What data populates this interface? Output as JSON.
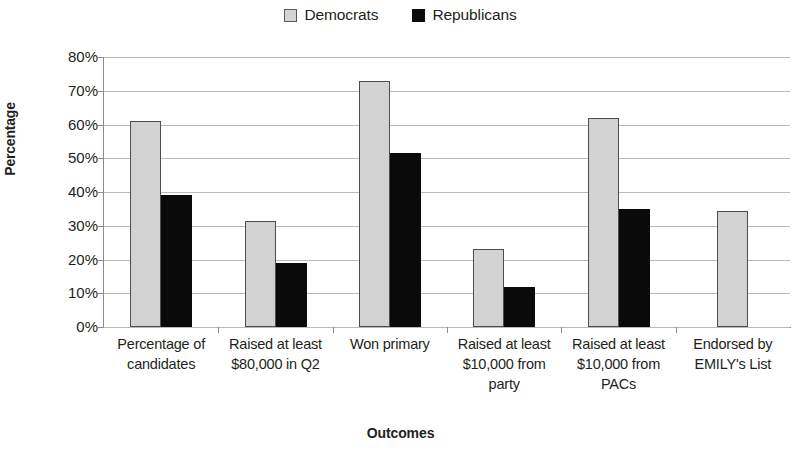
{
  "chart_data": {
    "type": "bar",
    "title": "",
    "xlabel": "Outcomes",
    "ylabel": "Percentage",
    "categories": [
      "Percentage of candidates",
      "Raised at least $80,000 in Q2",
      "Won primary",
      "Raised at least $10,000 from party",
      "Raised at least $10,000 from PACs",
      "Endorsed by EMILY's List"
    ],
    "series": [
      {
        "name": "Democrats",
        "color": "#d2d2d2",
        "values": [
          61,
          31.5,
          73,
          23,
          62,
          34.5
        ]
      },
      {
        "name": "Republicans",
        "color": "#0a0a0a",
        "values": [
          39,
          19,
          51.5,
          12,
          35,
          null
        ]
      }
    ],
    "ylim": [
      0,
      80
    ],
    "ytick_values": [
      0,
      10,
      20,
      30,
      40,
      50,
      60,
      70,
      80
    ],
    "ytick_labels": [
      "0%",
      "10%",
      "20%",
      "30%",
      "40%",
      "50%",
      "60%",
      "70%",
      "80%"
    ],
    "grid": true,
    "legend_position": "top-center"
  },
  "legend": {
    "entries": [
      {
        "label": "Democrats",
        "swatch": "light-gray-square"
      },
      {
        "label": "Republicans",
        "swatch": "black-square"
      }
    ]
  },
  "category_lines": [
    [
      "Percentage of",
      "candidates"
    ],
    [
      "Raised at least",
      "$80,000 in Q2"
    ],
    [
      "Won primary"
    ],
    [
      "Raised at least",
      "$10,000 from",
      "party"
    ],
    [
      "Raised at least",
      "$10,000 from",
      "PACs"
    ],
    [
      "Endorsed by",
      "EMILY's List"
    ]
  ]
}
